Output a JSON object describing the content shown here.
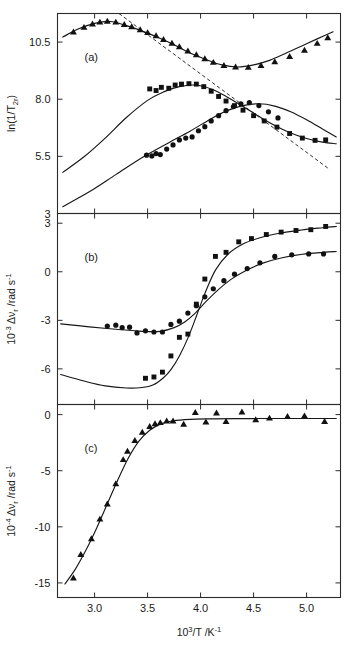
{
  "figure": {
    "xaxis": {
      "label_main": "10",
      "label_sup": "3",
      "label_rest": "/T /K",
      "label_sup2": "-1",
      "ticks": [
        "3.0",
        "3.5",
        "4.0",
        "4.5",
        "5.0"
      ],
      "tick_values": [
        3.0,
        3.5,
        4.0,
        4.5,
        5.0
      ],
      "min": 2.65,
      "max": 5.32
    },
    "panels": [
      {
        "tag": "(a)",
        "ylabel_pre": "ln(1/T",
        "ylabel_sub": "2r",
        "ylabel_post": ")",
        "yticks": [
          "10.5",
          "8.0",
          "5.5",
          "3"
        ],
        "ytick_values": [
          10.5,
          8.0,
          5.5,
          3.0
        ],
        "ymin": 3.0,
        "ymax": 11.75
      },
      {
        "tag": "(b)",
        "ylabel_pre": "10",
        "ylabel_sup": "-3",
        "ylabel_mid": " Δν",
        "ylabel_sub": "r",
        "ylabel_post": " /rad s",
        "ylabel_sup2": "-1",
        "yticks": [
          "3",
          "0",
          "-3",
          "-6"
        ],
        "ytick_values": [
          3.0,
          0.0,
          -3.0,
          -6.0
        ],
        "ymin": -8.2,
        "ymax": 3.6
      },
      {
        "tag": "(c)",
        "ylabel_pre": "10",
        "ylabel_sup": "-4",
        "ylabel_mid": " Δν",
        "ylabel_sub": "r",
        "ylabel_post": " /rad s",
        "ylabel_sup2": "-1",
        "yticks": [
          "0",
          "-5",
          "-10",
          "-15"
        ],
        "ytick_values": [
          0.0,
          -5.0,
          -10.0,
          -15.0
        ],
        "ymin": -16.3,
        "ymax": 0.9
      }
    ]
  },
  "chart_data": [
    {
      "type": "scatter",
      "panel": "(a)",
      "title": "",
      "xlabel": "10^3/T /K^-1",
      "ylabel": "ln(1/T_2r)",
      "xlim": [
        2.65,
        5.32
      ],
      "ylim": [
        3.0,
        11.75
      ],
      "grid": false,
      "legend": "none",
      "series": [
        {
          "name": "triangle-series",
          "marker": "triangle",
          "x": [
            2.8,
            2.9,
            2.98,
            3.05,
            3.12,
            3.2,
            3.28,
            3.35,
            3.43,
            3.5,
            3.58,
            3.65,
            3.73,
            3.8,
            3.88,
            3.96,
            4.04,
            4.12,
            4.22,
            4.33,
            4.45,
            4.57,
            4.7,
            4.84,
            4.98,
            5.1,
            5.2
          ],
          "y": [
            10.95,
            11.15,
            11.3,
            11.38,
            11.42,
            11.38,
            11.28,
            11.18,
            11.05,
            10.92,
            10.78,
            10.62,
            10.46,
            10.3,
            10.12,
            9.95,
            9.78,
            9.62,
            9.48,
            9.42,
            9.4,
            9.48,
            9.65,
            9.88,
            10.15,
            10.45,
            10.7
          ]
        },
        {
          "name": "square-series",
          "marker": "square",
          "x": [
            3.52,
            3.58,
            3.63,
            3.7,
            3.76,
            3.82,
            3.89,
            3.96,
            4.03,
            4.1,
            4.17,
            4.24,
            4.32,
            4.4,
            4.5,
            4.6,
            4.72,
            4.84,
            4.96,
            5.08,
            5.18
          ],
          "y": [
            8.45,
            8.38,
            8.52,
            8.48,
            8.62,
            8.66,
            8.68,
            8.66,
            8.55,
            8.35,
            8.12,
            7.92,
            7.72,
            7.52,
            7.28,
            7.05,
            6.78,
            6.5,
            6.3,
            6.2,
            6.22
          ]
        },
        {
          "name": "circle-series",
          "marker": "circle",
          "x": [
            3.49,
            3.54,
            3.58,
            3.62,
            3.68,
            3.74,
            3.8,
            3.86,
            3.92,
            3.98,
            4.04,
            4.1,
            4.17,
            4.24,
            4.31,
            4.38,
            4.46,
            4.55,
            4.64,
            4.73
          ],
          "y": [
            5.55,
            5.52,
            5.62,
            5.58,
            5.82,
            6.0,
            6.22,
            6.3,
            6.35,
            6.62,
            6.8,
            7.05,
            7.28,
            7.5,
            7.68,
            7.8,
            7.85,
            7.72,
            7.45,
            7.18
          ]
        }
      ],
      "fit_curves": [
        {
          "name": "triangle-fit",
          "type": "polynomial-smooth",
          "x": [
            2.7,
            2.85,
            3.0,
            3.15,
            3.3,
            3.45,
            3.6,
            3.75,
            3.9,
            4.05,
            4.2,
            4.35,
            4.5,
            4.65,
            4.8,
            4.95,
            5.1,
            5.25
          ],
          "y": [
            10.72,
            11.08,
            11.32,
            11.4,
            11.22,
            10.98,
            10.7,
            10.38,
            10.02,
            9.74,
            9.5,
            9.41,
            9.5,
            9.7,
            10.0,
            10.32,
            10.64,
            10.95
          ]
        },
        {
          "name": "square-fit",
          "type": "polynomial-smooth",
          "x": [
            2.7,
            2.9,
            3.1,
            3.3,
            3.5,
            3.65,
            3.8,
            3.95,
            4.1,
            4.25,
            4.4,
            4.55,
            4.7,
            4.85,
            5.0,
            5.15,
            5.28
          ],
          "y": [
            4.8,
            5.48,
            6.3,
            7.2,
            7.95,
            8.32,
            8.55,
            8.62,
            8.45,
            8.1,
            7.68,
            7.25,
            6.85,
            6.52,
            6.28,
            6.12,
            6.05
          ]
        },
        {
          "name": "circle-fit",
          "type": "polynomial-smooth",
          "x": [
            2.7,
            2.95,
            3.2,
            3.45,
            3.7,
            3.9,
            4.1,
            4.25,
            4.4,
            4.55,
            4.7,
            4.85,
            5.0,
            5.15,
            5.28
          ],
          "y": [
            3.3,
            3.95,
            4.7,
            5.45,
            6.1,
            6.6,
            7.15,
            7.5,
            7.72,
            7.8,
            7.7,
            7.45,
            7.1,
            6.7,
            6.35
          ]
        }
      ],
      "dashed_line": {
        "name": "arrhenius-asymptote",
        "x": [
          3.23,
          5.22
        ],
        "y": [
          11.75,
          4.92
        ]
      }
    },
    {
      "type": "scatter",
      "panel": "(b)",
      "title": "",
      "xlabel": "10^3/T /K^-1",
      "ylabel": "10^-3 dnu_r /rad s^-1",
      "xlim": [
        2.65,
        5.32
      ],
      "ylim": [
        -8.2,
        3.6
      ],
      "grid": false,
      "legend": "none",
      "series": [
        {
          "name": "square-series",
          "marker": "square",
          "x": [
            3.48,
            3.56,
            3.64,
            3.72,
            3.8,
            3.88,
            3.96,
            4.04,
            4.14,
            4.24,
            4.36,
            4.48,
            4.62,
            4.76,
            4.9,
            5.04,
            5.18
          ],
          "y": [
            -6.58,
            -6.5,
            -6.2,
            -5.2,
            -4.05,
            -3.85,
            -2.0,
            -0.45,
            0.95,
            1.2,
            1.85,
            2.05,
            2.3,
            2.45,
            2.55,
            2.6,
            2.8
          ]
        },
        {
          "name": "circle-series",
          "marker": "circle",
          "x": [
            3.12,
            3.2,
            3.26,
            3.33,
            3.4,
            3.48,
            3.56,
            3.64,
            3.72,
            3.8,
            3.88,
            3.96,
            4.04,
            4.12,
            4.22,
            4.32,
            4.44,
            4.56,
            4.7,
            4.86,
            5.02,
            5.16
          ],
          "y": [
            -3.35,
            -3.3,
            -3.45,
            -3.42,
            -3.78,
            -3.65,
            -3.72,
            -3.72,
            -3.25,
            -3.05,
            -2.55,
            -2.1,
            -1.55,
            -1.05,
            -0.55,
            -0.15,
            0.2,
            0.55,
            0.95,
            1.05,
            1.1,
            1.1
          ]
        }
      ],
      "fit_curves": [
        {
          "name": "square-fit",
          "type": "sigmoid",
          "x": [
            2.68,
            2.9,
            3.1,
            3.3,
            3.45,
            3.55,
            3.65,
            3.72,
            3.8,
            3.88,
            3.96,
            4.04,
            4.14,
            4.26,
            4.4,
            4.56,
            4.74,
            4.95,
            5.15,
            5.28
          ],
          "y": [
            -6.35,
            -6.75,
            -7.05,
            -7.18,
            -7.15,
            -7.0,
            -6.55,
            -6.05,
            -5.2,
            -4.1,
            -2.75,
            -1.35,
            0.1,
            1.1,
            1.72,
            2.1,
            2.38,
            2.58,
            2.72,
            2.8
          ]
        },
        {
          "name": "circle-fit",
          "type": "sigmoid",
          "x": [
            2.68,
            2.95,
            3.2,
            3.45,
            3.62,
            3.75,
            3.85,
            3.95,
            4.05,
            4.16,
            4.28,
            4.42,
            4.58,
            4.76,
            4.96,
            5.16,
            5.28
          ],
          "y": [
            -3.22,
            -3.4,
            -3.55,
            -3.68,
            -3.68,
            -3.45,
            -3.1,
            -2.55,
            -1.85,
            -1.15,
            -0.5,
            0.05,
            0.52,
            0.85,
            1.08,
            1.2,
            1.25
          ]
        }
      ]
    },
    {
      "type": "scatter",
      "panel": "(c)",
      "title": "",
      "xlabel": "10^3/T /K^-1",
      "ylabel": "10^-4 dnu_r /rad s^-1",
      "xlim": [
        2.65,
        5.32
      ],
      "ylim": [
        -16.3,
        0.9
      ],
      "grid": false,
      "legend": "none",
      "series": [
        {
          "name": "triangle-series",
          "marker": "triangle",
          "x": [
            2.8,
            2.87,
            2.97,
            3.05,
            3.12,
            3.2,
            3.27,
            3.31,
            3.38,
            3.45,
            3.52,
            3.57,
            3.62,
            3.68,
            3.74,
            3.84,
            3.95,
            4.05,
            4.15,
            4.24,
            4.39,
            4.52,
            4.65,
            4.82,
            4.98,
            5.17
          ],
          "y": [
            -14.55,
            -12.45,
            -11.05,
            -9.3,
            -7.95,
            -6.15,
            -4.0,
            -3.25,
            -2.3,
            -1.55,
            -1.05,
            -0.8,
            -0.7,
            -0.55,
            -0.55,
            -0.85,
            0.2,
            -0.65,
            0.15,
            -0.6,
            0.25,
            -0.45,
            -0.3,
            -0.15,
            -0.1,
            -0.6
          ]
        }
      ],
      "fit_curves": [
        {
          "name": "triangle-fit",
          "type": "sigmoid",
          "x": [
            2.72,
            2.82,
            2.92,
            3.02,
            3.12,
            3.22,
            3.32,
            3.42,
            3.52,
            3.62,
            3.74,
            3.9,
            4.1,
            4.35,
            4.65,
            4.95,
            5.28
          ],
          "y": [
            -15.1,
            -13.75,
            -12.05,
            -10.1,
            -7.95,
            -5.8,
            -3.85,
            -2.35,
            -1.4,
            -0.85,
            -0.55,
            -0.42,
            -0.38,
            -0.36,
            -0.35,
            -0.35,
            -0.35
          ]
        }
      ]
    }
  ]
}
